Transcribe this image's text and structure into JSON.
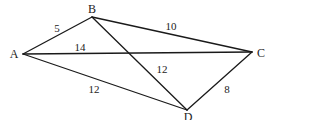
{
  "diagram": {
    "type": "geometry",
    "points": [
      {
        "id": "A",
        "label": "A",
        "x": 23,
        "y": 54,
        "lx": 14,
        "ly": 54
      },
      {
        "id": "B",
        "label": "B",
        "x": 92,
        "y": 17,
        "lx": 92,
        "ly": 9
      },
      {
        "id": "C",
        "label": "C",
        "x": 252,
        "y": 52,
        "lx": 261,
        "ly": 53
      },
      {
        "id": "D",
        "label": "D",
        "x": 187,
        "y": 110,
        "lx": 188,
        "ly": 117
      }
    ],
    "edges": [
      {
        "from": "A",
        "to": "B",
        "length": "5",
        "lx": 57,
        "ly": 28
      },
      {
        "from": "B",
        "to": "C",
        "length": "10",
        "lx": 171,
        "ly": 26
      },
      {
        "from": "A",
        "to": "C",
        "length": "14",
        "lx": 80,
        "ly": 47
      },
      {
        "from": "B",
        "to": "D",
        "length": "12",
        "lx": 162,
        "ly": 69
      },
      {
        "from": "A",
        "to": "D",
        "length": "12",
        "lx": 94,
        "ly": 89
      },
      {
        "from": "C",
        "to": "D",
        "length": "8",
        "lx": 227,
        "ly": 89
      }
    ],
    "line_color": "#1a1a1a"
  }
}
